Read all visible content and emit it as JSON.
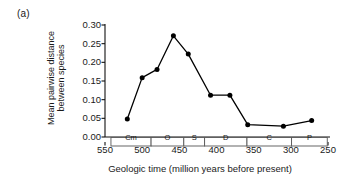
{
  "panel": {
    "label": "(a)"
  },
  "chart_data": {
    "type": "line",
    "title": "",
    "subtitle": "",
    "xlabel": "Geologic time (million years before present)",
    "ylabel": "Mean pairwise distance between species",
    "ylabel_lines": [
      "Mean pairwise distance",
      "between species"
    ],
    "xlim": [
      550,
      250
    ],
    "ylim": [
      0.0,
      0.3
    ],
    "x_reversed": true,
    "grid": false,
    "legend": "none",
    "marker": "filled-circle",
    "line_color": "#000000",
    "marker_color": "#000000",
    "xticks": [
      550,
      500,
      450,
      400,
      350,
      300,
      250
    ],
    "xtick_labels": [
      "550",
      "500",
      "450",
      "400",
      "350",
      "300",
      "250"
    ],
    "xticks_minor": [
      525,
      475,
      425,
      375,
      325,
      275
    ],
    "yticks": [
      0.0,
      0.05,
      0.1,
      0.15,
      0.2,
      0.25,
      0.3
    ],
    "ytick_labels": [
      "0.00",
      "0.05",
      "0.10",
      "0.15",
      "0.20",
      "0.25",
      "0.30"
    ],
    "x": [
      520,
      500,
      480,
      458,
      438,
      408,
      382,
      358,
      310,
      272
    ],
    "values": [
      0.048,
      0.159,
      0.181,
      0.271,
      0.222,
      0.112,
      0.112,
      0.033,
      0.029,
      0.044
    ],
    "points": [
      {
        "x": 520,
        "y": 0.048
      },
      {
        "x": 500,
        "y": 0.159
      },
      {
        "x": 480,
        "y": 0.181
      },
      {
        "x": 458,
        "y": 0.271
      },
      {
        "x": 438,
        "y": 0.222
      },
      {
        "x": 408,
        "y": 0.112
      },
      {
        "x": 382,
        "y": 0.112
      },
      {
        "x": 358,
        "y": 0.033
      },
      {
        "x": 310,
        "y": 0.029
      },
      {
        "x": 272,
        "y": 0.044
      }
    ],
    "period_bands": [
      {
        "label": "Cm",
        "start": 542,
        "end": 488
      },
      {
        "label": "O",
        "start": 488,
        "end": 444
      },
      {
        "label": "S",
        "start": 444,
        "end": 416
      },
      {
        "label": "D",
        "start": 416,
        "end": 359
      },
      {
        "label": "C",
        "start": 359,
        "end": 299
      },
      {
        "label": "P",
        "start": 299,
        "end": 251
      }
    ],
    "band_fill": "#ffffff",
    "band_stroke": "#555555"
  }
}
